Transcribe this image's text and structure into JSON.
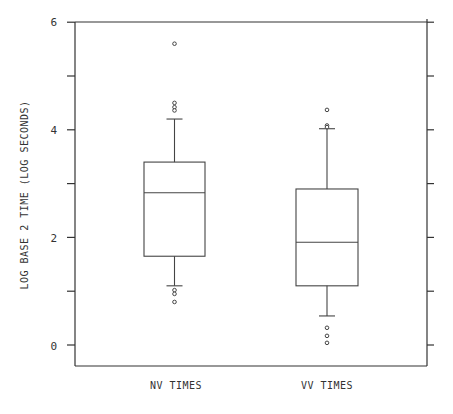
{
  "chart_data": {
    "type": "box",
    "title": "",
    "xlabel": "",
    "ylabel": "LOG BASE 2 TIME (LOG SECONDS)",
    "ylim": [
      -0.4,
      6
    ],
    "yticks": [
      0,
      2,
      4,
      6
    ],
    "yticks_minor": [
      1,
      3,
      5
    ],
    "right_axis_ticks": [
      0,
      1,
      2,
      3,
      4,
      5,
      6
    ],
    "grid": false,
    "categories": [
      "NV TIMES",
      "VV TIMES"
    ],
    "series": [
      {
        "name": "NV TIMES",
        "whisker_low": 1.1,
        "q1": 1.65,
        "median": 2.83,
        "q3": 3.4,
        "whisker_high": 4.2,
        "outliers": [
          5.6,
          4.5,
          4.42,
          4.36,
          1.02,
          0.95,
          0.8
        ]
      },
      {
        "name": "VV TIMES",
        "whisker_low": 0.54,
        "q1": 1.1,
        "median": 1.91,
        "q3": 2.9,
        "whisker_high": 4.02,
        "outliers": [
          4.37,
          4.08,
          4.05,
          0.32,
          0.17,
          0.04
        ]
      }
    ]
  },
  "labels": {
    "y_axis": "LOG BASE 2 TIME (LOG SECONDS)",
    "y_tick_0": "0",
    "y_tick_2": "2",
    "y_tick_4": "4",
    "y_tick_6": "6",
    "cat_0": "NV TIMES",
    "cat_1": "VV TIMES"
  }
}
